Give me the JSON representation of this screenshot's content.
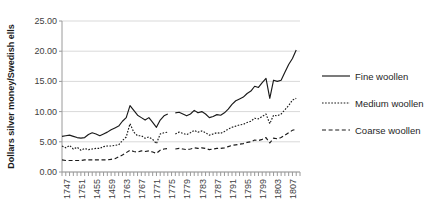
{
  "chart_data": {
    "type": "line",
    "title": "",
    "xlabel": "",
    "ylabel": "Dollars silver money/Swedish ells",
    "ylim": [
      0,
      25
    ],
    "ytick_labels": [
      "0.00",
      "5.00",
      "10.00",
      "15.00",
      "20.00",
      "25.00"
    ],
    "ytick_values": [
      0,
      5,
      10,
      15,
      20,
      25
    ],
    "grid": true,
    "legend_position": "right",
    "x_start": 1745,
    "x_end": 1808,
    "xtick_labels": [
      "1747",
      "1751",
      "1455",
      "1459",
      "1763",
      "1767",
      "1771",
      "1775",
      "1779",
      "1783",
      "1787",
      "1791",
      "1795",
      "1799",
      "1803",
      "1807"
    ],
    "xtick_values": [
      1747,
      1751,
      1755,
      1759,
      1763,
      1767,
      1771,
      1775,
      1779,
      1783,
      1787,
      1791,
      1795,
      1799,
      1803,
      1807
    ],
    "x": [
      1745,
      1746,
      1747,
      1748,
      1749,
      1750,
      1751,
      1752,
      1753,
      1754,
      1755,
      1756,
      1757,
      1758,
      1759,
      1760,
      1761,
      1762,
      1763,
      1764,
      1765,
      1766,
      1767,
      1768,
      1769,
      1770,
      1771,
      1772,
      1773,
      1774,
      1775,
      1776,
      1777,
      1778,
      1779,
      1780,
      1781,
      1782,
      1783,
      1784,
      1785,
      1786,
      1787,
      1788,
      1789,
      1790,
      1791,
      1792,
      1793,
      1794,
      1795,
      1796,
      1797,
      1798,
      1799,
      1800,
      1801,
      1802,
      1803,
      1804,
      1805,
      1806,
      1807,
      1808
    ],
    "series": [
      {
        "name": "Fine woollen",
        "style": "solid",
        "values": [
          5.9,
          6.0,
          6.1,
          5.9,
          5.7,
          5.6,
          5.7,
          6.2,
          6.5,
          6.3,
          6.0,
          6.3,
          6.6,
          7.0,
          7.3,
          7.6,
          8.4,
          9.0,
          11.0,
          10.2,
          9.4,
          9.0,
          8.6,
          9.0,
          8.2,
          7.4,
          8.6,
          9.3,
          9.6,
          null,
          9.8,
          9.9,
          9.6,
          9.3,
          9.6,
          10.2,
          9.8,
          10.0,
          9.6,
          9.0,
          9.2,
          9.5,
          9.4,
          9.8,
          10.4,
          11.2,
          11.8,
          12.1,
          12.4,
          13.0,
          13.4,
          14.2,
          14.0,
          14.8,
          15.5,
          12.2,
          15.2,
          15.0,
          15.2,
          16.5,
          17.8,
          18.8,
          20.2,
          null
        ]
      },
      {
        "name": "Medium woollen",
        "style": "dotted",
        "values": [
          4.3,
          4.0,
          4.4,
          3.8,
          4.1,
          3.6,
          3.9,
          3.7,
          3.8,
          3.9,
          3.9,
          4.2,
          4.3,
          4.3,
          4.4,
          4.5,
          5.2,
          5.8,
          8.0,
          6.6,
          6.0,
          6.0,
          5.6,
          5.8,
          5.4,
          4.7,
          6.3,
          6.5,
          6.6,
          null,
          6.3,
          6.6,
          6.4,
          6.2,
          6.5,
          6.9,
          6.6,
          6.8,
          6.5,
          6.1,
          6.3,
          6.5,
          6.4,
          6.7,
          7.1,
          7.4,
          7.6,
          7.8,
          7.9,
          8.2,
          8.4,
          8.9,
          8.8,
          9.2,
          9.6,
          8.0,
          9.4,
          9.3,
          9.6,
          10.3,
          11.0,
          11.9,
          12.2,
          null
        ]
      },
      {
        "name": "Coarse woollen",
        "style": "dashed",
        "values": [
          2.0,
          1.9,
          1.9,
          1.9,
          1.9,
          1.9,
          2.0,
          2.0,
          2.0,
          2.0,
          2.0,
          2.0,
          2.0,
          2.1,
          2.2,
          2.5,
          2.8,
          3.2,
          3.6,
          3.4,
          3.3,
          3.5,
          3.4,
          3.5,
          3.3,
          3.1,
          3.6,
          3.8,
          3.9,
          null,
          3.8,
          3.9,
          3.8,
          3.7,
          3.8,
          4.0,
          3.9,
          4.0,
          3.9,
          3.7,
          3.8,
          3.9,
          3.9,
          4.0,
          4.2,
          4.4,
          4.5,
          4.6,
          4.7,
          4.9,
          5.0,
          5.3,
          5.2,
          5.4,
          5.7,
          4.8,
          5.6,
          5.5,
          5.7,
          6.1,
          6.5,
          6.9,
          7.1,
          null
        ]
      }
    ]
  },
  "legend": {
    "items": [
      {
        "label": "Fine woollen",
        "style": "solid"
      },
      {
        "label": "Medium woollen",
        "style": "dotted"
      },
      {
        "label": "Coarse woollen",
        "style": "dashed"
      }
    ]
  }
}
